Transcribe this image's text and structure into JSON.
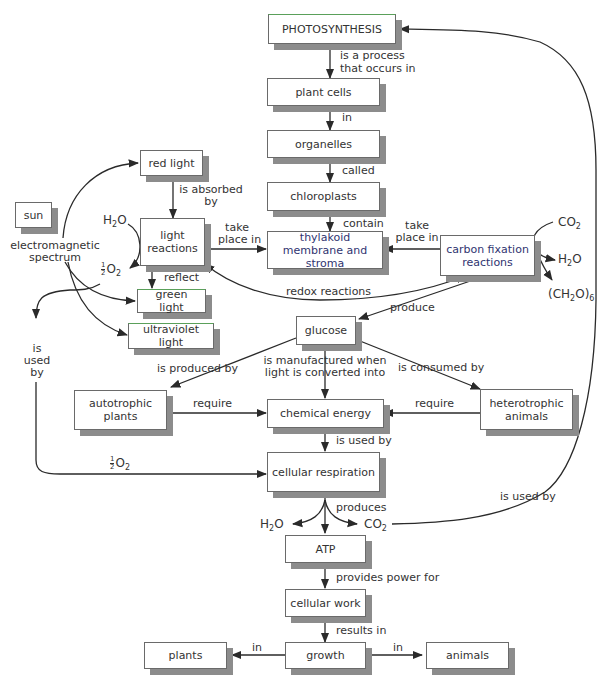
{
  "nodes": {
    "photosynthesis": "PHOTOSYNTHESIS",
    "plant_cells": "plant cells",
    "organelles": "organelles",
    "chloroplasts": "chloroplasts",
    "thylakoid": "thylakoid membrane and stroma",
    "carbon_fixation": "carbon fixation reactions",
    "light_reactions": "light reactions",
    "red_light": "red light",
    "sun": "sun",
    "green_light": "green light",
    "ultraviolet_light": "ultraviolet light",
    "glucose": "glucose",
    "autotrophic_plants": "autotrophic plants",
    "chemical_energy": "chemical energy",
    "heterotrophic_animals": "heterotrophic animals",
    "cellular_respiration": "cellular respiration",
    "atp": "ATP",
    "cellular_work": "cellular work",
    "growth": "growth",
    "plants": "plants",
    "animals": "animals"
  },
  "links": {
    "is_a_process_1": "is a process",
    "is_a_process_2": "that occurs in",
    "in_1": "in",
    "called": "called",
    "contain": "contain",
    "take_place_in_left_1": "take",
    "take_place_in_left_2": "place in",
    "take_place_in_right_1": "take",
    "take_place_in_right_2": "place in",
    "is_absorbed_by_1": "is absorbed",
    "is_absorbed_by_2": "by",
    "electromagnetic_1": "electromagnetic",
    "electromagnetic_2": "spectrum",
    "reflect": "reflect",
    "redox_reactions": "redox reactions",
    "produce": "produce",
    "is_used_by_left_1": "is",
    "is_used_by_left_2": "used",
    "is_used_by_left_3": "by",
    "is_produced_by": "is produced by",
    "is_manufactured_1": "is manufactured when",
    "is_manufactured_2": "light is converted into",
    "is_consumed_by": "is consumed by",
    "require_left": "require",
    "require_right": "require",
    "is_used_by_mid": "is used by",
    "produces": "produces",
    "is_used_by_right": "is used by",
    "provides_power_for": "provides power for",
    "results_in": "results in",
    "in_left": "in",
    "in_right": "in"
  },
  "chemicals": {
    "h2o_light": "H2O",
    "half_o2_light": "½O2",
    "co2_cf": "CO2",
    "h2o_cf": "H2O",
    "ch2o6": "(CH2O)6",
    "half_o2_resp": "½O2",
    "h2o_resp": "H2O",
    "co2_resp": "CO2"
  },
  "colors": {
    "line": "#2a2a2a",
    "shadow": "#8c8c8c",
    "border": "#6a6a6a",
    "accent_green": "#5aa05a",
    "accent_blue_text": "#2f3470"
  }
}
